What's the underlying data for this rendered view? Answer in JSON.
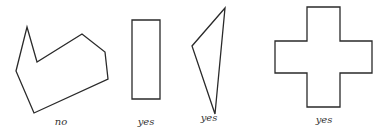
{
  "figures": [
    {
      "name": "concave-polygon",
      "label": "no",
      "points": "27,27 37,62 82,34 105,52 108,79 34,113 16,71"
    },
    {
      "name": "rectangle",
      "label": "yes",
      "points": "132,20 160,20 160,99 132,99"
    },
    {
      "name": "triangle",
      "label": "yes",
      "points": "225,8 192,46 215,114"
    },
    {
      "name": "cross",
      "label": "yes",
      "points": "307,7 340,7 340,41 372,41 372,73 340,73 340,107 307,107 307,73 275,73 275,41 307,41"
    }
  ],
  "stroke_color": "#2a2a2a"
}
